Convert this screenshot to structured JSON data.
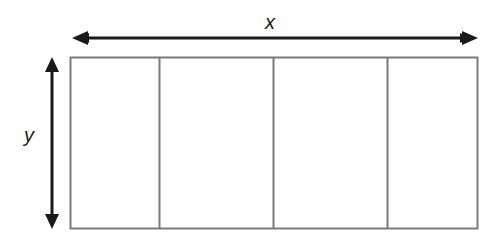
{
  "diagram": {
    "type": "dimensioned-rectangle",
    "labels": {
      "width": "x",
      "height": "y"
    },
    "rectangle": {
      "left": 70,
      "top": 57,
      "right": 478,
      "bottom": 229,
      "stroke": "#7a7a7a",
      "sections": 4,
      "dividers_x": [
        159,
        273,
        387
      ]
    },
    "arrows": {
      "horizontal": {
        "y": 38,
        "x1": 72,
        "x2": 477,
        "color": "#1a1a1a",
        "double_headed": true
      },
      "vertical": {
        "x": 52,
        "y1": 57,
        "y2": 228,
        "color": "#1a1a1a",
        "double_headed": true
      }
    }
  }
}
